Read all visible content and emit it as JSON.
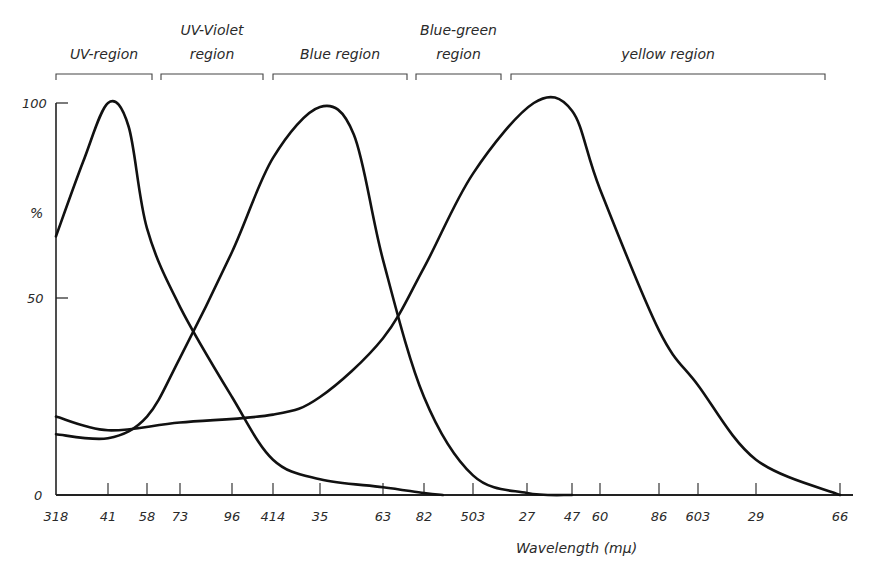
{
  "chart_data": {
    "type": "line",
    "title": "",
    "xlabel": "Wavelength (mμ)",
    "ylabel": "%",
    "ylim": [
      0,
      100
    ],
    "grid": false,
    "legend": "none",
    "y_ticks": [
      {
        "value": 0,
        "label": "0"
      },
      {
        "value": 50,
        "label": "50"
      },
      {
        "value": 100,
        "label": "100"
      }
    ],
    "x_ticks": [
      {
        "label": "318",
        "px": 56
      },
      {
        "label": "41",
        "px": 108
      },
      {
        "label": "58",
        "px": 147
      },
      {
        "label": "73",
        "px": 180
      },
      {
        "label": "96",
        "px": 232
      },
      {
        "label": "414",
        "px": 273
      },
      {
        "label": "35",
        "px": 320
      },
      {
        "label": "63",
        "px": 383
      },
      {
        "label": "82",
        "px": 424
      },
      {
        "label": "503",
        "px": 473
      },
      {
        "label": "27",
        "px": 527
      },
      {
        "label": "47",
        "px": 572
      },
      {
        "label": "60",
        "px": 600
      },
      {
        "label": "86",
        "px": 659
      },
      {
        "label": "603",
        "px": 698
      },
      {
        "label": "29",
        "px": 756
      },
      {
        "label": "66",
        "px": 840
      }
    ],
    "regions": [
      {
        "label_lines": [
          "UV-region"
        ],
        "x_start": 56,
        "x_end": 152
      },
      {
        "label_lines": [
          "UV-Violet",
          "region"
        ],
        "x_start": 161,
        "x_end": 263
      },
      {
        "label_lines": [
          "Blue region"
        ],
        "x_start": 273,
        "x_end": 407
      },
      {
        "label_lines": [
          "Blue-green",
          "region"
        ],
        "x_start": 416,
        "x_end": 501
      },
      {
        "label_lines": [
          "yellow region"
        ],
        "x_start": 511,
        "x_end": 825
      }
    ],
    "series": [
      {
        "name": "UV-violet peak curve",
        "peak_wavelength": 341,
        "points": [
          {
            "wl": 318,
            "y": 66
          },
          {
            "wl": 330,
            "y": 85
          },
          {
            "wl": 341,
            "y": 100
          },
          {
            "wl": 350,
            "y": 94
          },
          {
            "wl": 358,
            "y": 68
          },
          {
            "wl": 373,
            "y": 48
          },
          {
            "wl": 396,
            "y": 25
          },
          {
            "wl": 414,
            "y": 9
          },
          {
            "wl": 435,
            "y": 4
          },
          {
            "wl": 463,
            "y": 2
          },
          {
            "wl": 482,
            "y": 0.5
          },
          {
            "wl": 490,
            "y": 0
          }
        ]
      },
      {
        "name": "Blue peak curve",
        "peak_wavelength": 435,
        "points": [
          {
            "wl": 318,
            "y": 15.5
          },
          {
            "wl": 341,
            "y": 14.5
          },
          {
            "wl": 358,
            "y": 20
          },
          {
            "wl": 373,
            "y": 35
          },
          {
            "wl": 396,
            "y": 62
          },
          {
            "wl": 414,
            "y": 86
          },
          {
            "wl": 435,
            "y": 99
          },
          {
            "wl": 450,
            "y": 92
          },
          {
            "wl": 463,
            "y": 60
          },
          {
            "wl": 482,
            "y": 25
          },
          {
            "wl": 503,
            "y": 5
          },
          {
            "wl": 527,
            "y": 0.5
          },
          {
            "wl": 547,
            "y": 0
          }
        ]
      },
      {
        "name": "Yellow peak curve",
        "peak_wavelength": 530,
        "points": [
          {
            "wl": 318,
            "y": 20
          },
          {
            "wl": 341,
            "y": 16.5
          },
          {
            "wl": 373,
            "y": 18.5
          },
          {
            "wl": 414,
            "y": 20.5
          },
          {
            "wl": 435,
            "y": 25
          },
          {
            "wl": 463,
            "y": 40
          },
          {
            "wl": 482,
            "y": 58
          },
          {
            "wl": 503,
            "y": 82
          },
          {
            "wl": 530,
            "y": 100
          },
          {
            "wl": 547,
            "y": 98
          },
          {
            "wl": 560,
            "y": 78
          },
          {
            "wl": 586,
            "y": 42
          },
          {
            "wl": 603,
            "y": 28
          },
          {
            "wl": 629,
            "y": 9
          },
          {
            "wl": 666,
            "y": 0
          }
        ]
      }
    ]
  }
}
